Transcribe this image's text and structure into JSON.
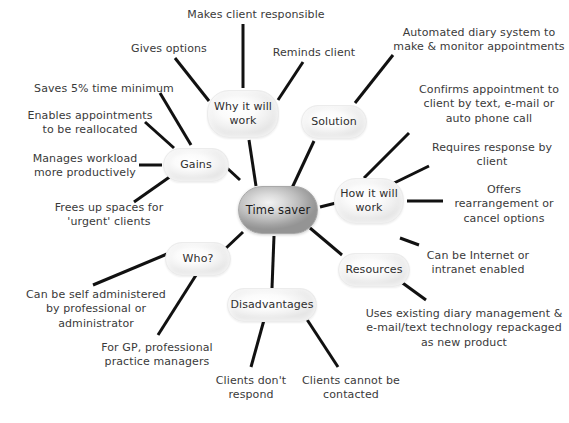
{
  "diagram": {
    "type": "mind-map",
    "background_color": "#ffffff",
    "center_node_color": "#bdbdbd",
    "branch_node_color": "#f1f1f1",
    "connector_color": "#111111",
    "text_color": "#3a3a3a"
  },
  "center": {
    "label": "Time saver",
    "x": 238,
    "y": 186,
    "w": 80,
    "h": 48
  },
  "branches": [
    {
      "id": "why",
      "label": "Why it will\nwork",
      "x": 207,
      "y": 90,
      "w": 72,
      "h": 48
    },
    {
      "id": "solution",
      "label": "Solution",
      "x": 301,
      "y": 105,
      "w": 66,
      "h": 34
    },
    {
      "id": "how",
      "label": "How it will\nwork",
      "x": 334,
      "y": 178,
      "w": 70,
      "h": 46
    },
    {
      "id": "resources",
      "label": "Resources",
      "x": 338,
      "y": 253,
      "w": 72,
      "h": 34
    },
    {
      "id": "disadvantages",
      "label": "Disadvantages",
      "x": 227,
      "y": 288,
      "w": 90,
      "h": 34
    },
    {
      "id": "who",
      "label": "Who?",
      "x": 165,
      "y": 242,
      "w": 66,
      "h": 34
    },
    {
      "id": "gains",
      "label": "Gains",
      "x": 163,
      "y": 148,
      "w": 66,
      "h": 34
    }
  ],
  "leaves": [
    {
      "id": "makes-client-responsible",
      "parent": "why",
      "text": "Makes client responsible",
      "x": 186,
      "y": 8,
      "w": 140,
      "align": "center"
    },
    {
      "id": "gives-options",
      "parent": "why",
      "text": "Gives options",
      "x": 125,
      "y": 42,
      "w": 88,
      "align": "center"
    },
    {
      "id": "reminds-client",
      "parent": "why",
      "text": "Reminds client",
      "x": 268,
      "y": 46,
      "w": 92,
      "align": "center"
    },
    {
      "id": "automated-diary-system",
      "parent": "solution",
      "text": "Automated diary system to\nmake & monitor appointments",
      "x": 392,
      "y": 26,
      "w": 174,
      "align": "center"
    },
    {
      "id": "confirms-appointment",
      "parent": "how",
      "text": "Confirms appointment to\nclient by text, e-mail or\nauto phone call",
      "x": 410,
      "y": 83,
      "w": 158,
      "align": "center"
    },
    {
      "id": "requires-response",
      "parent": "how",
      "text": "Requires response by\nclient",
      "x": 424,
      "y": 141,
      "w": 136,
      "align": "center"
    },
    {
      "id": "offers-rearrangement",
      "parent": "how",
      "text": "Offers\nrearrangement or\ncancel options",
      "x": 443,
      "y": 183,
      "w": 122,
      "align": "center"
    },
    {
      "id": "internet-intranet",
      "parent": "resources",
      "text": "Can be Internet or\nintranet enabled",
      "x": 414,
      "y": 249,
      "w": 128,
      "align": "center"
    },
    {
      "id": "uses-existing-diary",
      "parent": "resources",
      "text": "Uses existing diary management &\ne-mail/text technology repackaged\nas new product",
      "x": 362,
      "y": 307,
      "w": 204,
      "align": "center"
    },
    {
      "id": "clients-cannot-be-contacted",
      "parent": "disadvantages",
      "text": "Clients cannot be\ncontacted",
      "x": 298,
      "y": 374,
      "w": 106,
      "align": "center"
    },
    {
      "id": "clients-dont-respond",
      "parent": "disadvantages",
      "text": "Clients don't\nrespond",
      "x": 209,
      "y": 374,
      "w": 84,
      "align": "center"
    },
    {
      "id": "for-gp-professional",
      "parent": "who",
      "text": "For GP, professional\npractice managers",
      "x": 95,
      "y": 341,
      "w": 124,
      "align": "center"
    },
    {
      "id": "self-administered",
      "parent": "who",
      "text": "Can be self administered\nby professional or\nadministrator",
      "x": 22,
      "y": 288,
      "w": 148,
      "align": "center"
    },
    {
      "id": "frees-up-spaces",
      "parent": "gains",
      "text": "Frees up spaces for\n'urgent' clients",
      "x": 48,
      "y": 201,
      "w": 122,
      "align": "center"
    },
    {
      "id": "manages-workload",
      "parent": "gains",
      "text": "Manages workload\nmore productively",
      "x": 26,
      "y": 152,
      "w": 118,
      "align": "center"
    },
    {
      "id": "enables-appointments",
      "parent": "gains",
      "text": "Enables appointments\nto be reallocated",
      "x": 23,
      "y": 109,
      "w": 134,
      "align": "center"
    },
    {
      "id": "saves-5-percent",
      "parent": "gains",
      "text": "Saves 5% time minimum",
      "x": 29,
      "y": 82,
      "w": 150,
      "align": "center"
    },
    {
      "id": "gives-options-dup",
      "parent": "why",
      "text": "",
      "x": 0,
      "y": 0,
      "w": 0,
      "align": "center"
    }
  ],
  "edges": [
    {
      "id": "center-why",
      "from": "center",
      "to": "why",
      "x1": 256,
      "y1": 186,
      "x2": 249,
      "y2": 140
    },
    {
      "id": "center-solution",
      "from": "center",
      "to": "solution",
      "x1": 292,
      "y1": 188,
      "x2": 314,
      "y2": 141
    },
    {
      "id": "center-how",
      "from": "center",
      "to": "how",
      "x1": 320,
      "y1": 207,
      "x2": 336,
      "y2": 203
    },
    {
      "id": "center-resources",
      "from": "center",
      "to": "resources",
      "x1": 310,
      "y1": 228,
      "x2": 342,
      "y2": 255
    },
    {
      "id": "center-disadvantages",
      "from": "center",
      "to": "disadvantages",
      "x1": 274,
      "y1": 236,
      "x2": 272,
      "y2": 288
    },
    {
      "id": "center-who",
      "from": "center",
      "to": "who",
      "x1": 243,
      "y1": 232,
      "x2": 224,
      "y2": 250
    },
    {
      "id": "center-gains",
      "from": "center",
      "to": "gains",
      "x1": 240,
      "y1": 180,
      "x2": 227,
      "y2": 168
    },
    {
      "id": "why-makes-client",
      "from": "why",
      "to": "makes-client-responsible",
      "x1": 243,
      "y1": 88,
      "x2": 243,
      "y2": 24
    },
    {
      "id": "why-gives-options",
      "from": "why",
      "to": "gives-options",
      "x1": 209,
      "y1": 101,
      "x2": 175,
      "y2": 58
    },
    {
      "id": "why-reminds-client",
      "from": "why",
      "to": "reminds-client",
      "x1": 278,
      "y1": 100,
      "x2": 303,
      "y2": 62
    },
    {
      "id": "solution-automated",
      "from": "solution",
      "to": "automated-diary-system",
      "x1": 355,
      "y1": 103,
      "x2": 393,
      "y2": 55
    },
    {
      "id": "how-confirms",
      "from": "how",
      "to": "confirms-appointment",
      "x1": 364,
      "y1": 178,
      "x2": 409,
      "y2": 133
    },
    {
      "id": "how-requires",
      "from": "how",
      "to": "requires-response",
      "x1": 388,
      "y1": 186,
      "x2": 429,
      "y2": 166
    },
    {
      "id": "how-offers",
      "from": "how",
      "to": "offers-rearrangement",
      "x1": 407,
      "y1": 201,
      "x2": 443,
      "y2": 201
    },
    {
      "id": "resources-internet",
      "from": "resources",
      "to": "internet-intranet",
      "x1": 400,
      "y1": 238,
      "x2": 419,
      "y2": 245
    },
    {
      "id": "resources-uses",
      "from": "resources",
      "to": "uses-existing-diary",
      "x1": 382,
      "y1": 268,
      "x2": 426,
      "y2": 300
    },
    {
      "id": "disadvantages-cannot",
      "from": "disadvantages",
      "to": "clients-cannot-be-contacted",
      "x1": 306,
      "y1": 318,
      "x2": 338,
      "y2": 367
    },
    {
      "id": "disadvantages-dont",
      "from": "disadvantages",
      "to": "clients-dont-respond",
      "x1": 264,
      "y1": 320,
      "x2": 251,
      "y2": 367
    },
    {
      "id": "who-forgp",
      "from": "who",
      "to": "for-gp-professional",
      "x1": 198,
      "y1": 272,
      "x2": 158,
      "y2": 335
    },
    {
      "id": "who-self",
      "from": "who",
      "to": "self-administered",
      "x1": 167,
      "y1": 254,
      "x2": 93,
      "y2": 285
    },
    {
      "id": "gains-frees",
      "from": "gains",
      "to": "frees-up-spaces",
      "x1": 171,
      "y1": 176,
      "x2": 134,
      "y2": 202
    },
    {
      "id": "gains-manages",
      "from": "gains",
      "to": "manages-workload",
      "x1": 162,
      "y1": 165,
      "x2": 139,
      "y2": 165
    },
    {
      "id": "gains-enables",
      "from": "gains",
      "to": "enables-appointments",
      "x1": 174,
      "y1": 148,
      "x2": 145,
      "y2": 122
    },
    {
      "id": "gains-saves",
      "from": "gains",
      "to": "saves-5-percent",
      "x1": 191,
      "y1": 145,
      "x2": 160,
      "y2": 93
    }
  ]
}
